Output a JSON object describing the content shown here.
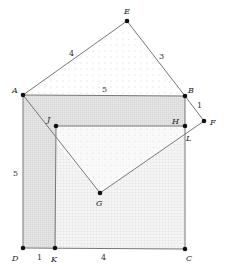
{
  "diagram": {
    "type": "geometry-proof",
    "points": {
      "E": {
        "label": "E",
        "x": 127,
        "y": 21,
        "lx": 124,
        "ly": 12
      },
      "A": {
        "label": "A",
        "x": 23,
        "y": 95,
        "lx": 13,
        "ly": 92
      },
      "B": {
        "label": "B",
        "x": 185,
        "y": 96,
        "lx": 188,
        "ly": 92
      },
      "F": {
        "label": "F",
        "x": 204,
        "y": 121,
        "lx": 211,
        "ly": 125
      },
      "J": {
        "label": "J",
        "x": 56,
        "y": 126,
        "lx": 47,
        "ly": 121
      },
      "H": {
        "label": "H",
        "x": 185,
        "y": 126,
        "lx": 172,
        "ly": 123
      },
      "L": {
        "label": "L",
        "x": 185,
        "y": 136,
        "lx": 187,
        "ly": 140
      },
      "G": {
        "label": "G",
        "x": 100,
        "y": 193,
        "lx": 96,
        "ly": 206
      },
      "D": {
        "label": "D",
        "x": 23,
        "y": 248,
        "lx": 12,
        "ly": 260
      },
      "K": {
        "label": "K",
        "x": 55,
        "y": 248,
        "lx": 52,
        "ly": 261
      },
      "C": {
        "label": "C",
        "x": 185,
        "y": 249,
        "lx": 187,
        "ly": 260
      }
    },
    "edge_labels": {
      "AE": {
        "text": "4",
        "x": 71,
        "y": 55
      },
      "EB": {
        "text": "3",
        "x": 161,
        "y": 59
      },
      "AB": {
        "text": "5",
        "x": 104,
        "y": 91
      },
      "BF": {
        "text": "1",
        "x": 198,
        "y": 107
      },
      "AD": {
        "text": "5",
        "x": 14,
        "y": 175
      },
      "DK": {
        "text": "1",
        "x": 37,
        "y": 260
      },
      "KC": {
        "text": "4",
        "x": 103,
        "y": 260
      }
    },
    "colors": {
      "line": "#777777",
      "point": "#111111",
      "fill_light": "#f4f4f4",
      "fill_medium": "#e4e4e4",
      "fill_dark": "#d6d6d6"
    }
  }
}
